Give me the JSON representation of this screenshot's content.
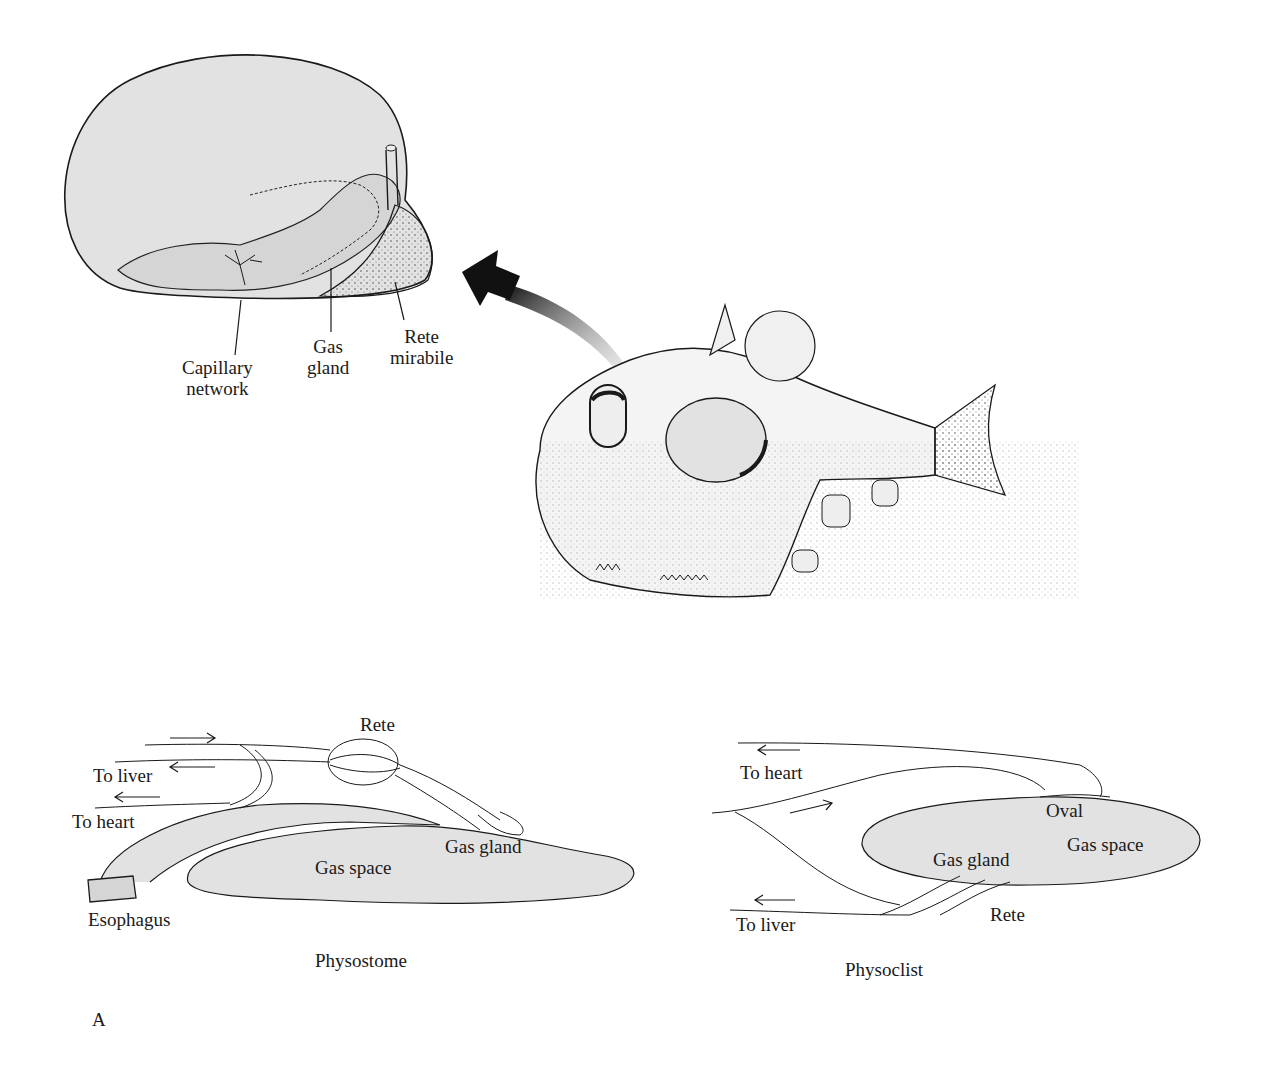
{
  "figure": {
    "panel_letter": "A",
    "swim_bladder_detail": {
      "labels": {
        "capillary_network": [
          "Capillary",
          "network"
        ],
        "gas_gland": [
          "Gas",
          "gland"
        ],
        "rete_mirabile": [
          "Rete",
          "mirabile"
        ]
      }
    },
    "fish": {
      "icon": "hatchetfish-illustration",
      "arrow": "curved-arrow-to-detail"
    },
    "physostome": {
      "caption": "Physostome",
      "labels": {
        "rete": "Rete",
        "to_liver": "To liver",
        "to_heart": "To heart",
        "gas_gland": "Gas gland",
        "gas_space": "Gas space",
        "esophagus": "Esophagus"
      },
      "arrows": [
        "right",
        "left",
        "left"
      ]
    },
    "physoclist": {
      "caption": "Physoclist",
      "labels": {
        "to_heart": "To heart",
        "oval": "Oval",
        "gas_space": "Gas space",
        "gas_gland": "Gas gland",
        "rete": "Rete",
        "to_liver": "To liver"
      },
      "arrows": [
        "left",
        "right",
        "left"
      ]
    },
    "colors": {
      "fill_gray": "#e2e2e2",
      "ink": "#1a1a1a",
      "background": "#ffffff"
    }
  }
}
